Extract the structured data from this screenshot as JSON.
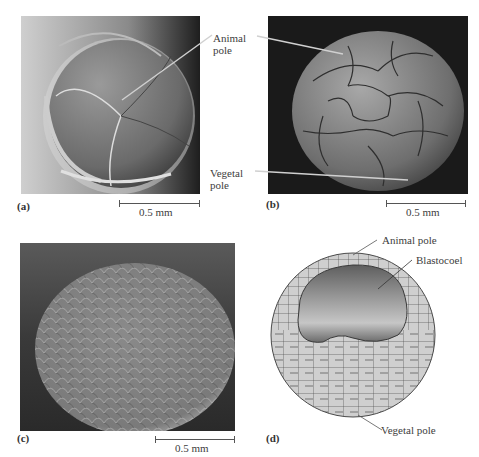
{
  "panels": {
    "a": {
      "letter": "(a)",
      "scale": "0.5 mm",
      "description": "8-cell embryo, scanning electron micrograph"
    },
    "b": {
      "letter": "(b)",
      "scale": "0.5 mm",
      "description": "Later cleavage embryo, scanning electron micrograph"
    },
    "c": {
      "letter": "(c)",
      "scale": "0.5 mm",
      "description": "Blastula surface, scanning electron micrograph"
    },
    "d": {
      "letter": "(d)",
      "description": "Blastula cross-section diagram"
    }
  },
  "labels": {
    "animal_pole_line1": "Animal",
    "animal_pole_line2": "pole",
    "vegetal_pole_line1": "Vegetal",
    "vegetal_pole_line2": "pole",
    "d_animal_pole": "Animal pole",
    "d_blastocoel": "Blastocoel",
    "d_vegetal_pole": "Vegetal pole"
  },
  "colors": {
    "cell_fill": "#cfcfcf",
    "cell_stroke": "#4a4a4a",
    "blastocoel_dark": "#5a5a5a",
    "blastocoel_light": "#c8c8c8"
  }
}
